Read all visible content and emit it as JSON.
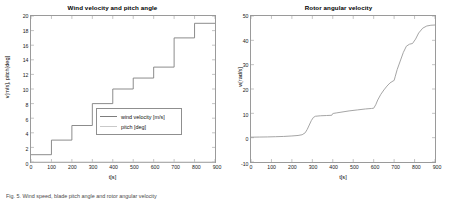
{
  "figure": {
    "caption": "Fig. 5.  Wind speed, blade pitch angle and rotor angular velocity"
  },
  "chart_data": [
    {
      "type": "line",
      "title": "Wind velocity and pitch angle",
      "xlabel": "t[s]",
      "ylabel": "v[m/s], pitch[deg]",
      "xlim": [
        0,
        900
      ],
      "ylim": [
        0,
        20
      ],
      "xticks": [
        0,
        100,
        200,
        300,
        400,
        500,
        600,
        700,
        800,
        900
      ],
      "yticks": [
        0,
        2,
        4,
        6,
        8,
        10,
        12,
        14,
        16,
        18,
        20
      ],
      "grid": false,
      "legend_position": "lower-right",
      "legend": [
        "wind velocity [m/s]",
        "pitch [deg]"
      ],
      "series": [
        {
          "name": "wind velocity [m/s]",
          "color": "#7d7d7d",
          "step": true,
          "x": [
            0,
            100,
            200,
            300,
            400,
            500,
            600,
            700,
            800,
            900
          ],
          "values": [
            1,
            3,
            5,
            8,
            10,
            11.5,
            13,
            17,
            19,
            19
          ]
        },
        {
          "name": "pitch [deg]",
          "color": "#c9c9c9",
          "step": true,
          "x": [
            0,
            900
          ],
          "values": [
            0,
            0
          ]
        }
      ]
    },
    {
      "type": "line",
      "title": "Rotor angular velocity",
      "xlabel": "t[s]",
      "ylabel": "w[rad/s]",
      "xlim": [
        0,
        900
      ],
      "ylim": [
        -10,
        50
      ],
      "xticks": [
        0,
        100,
        200,
        300,
        400,
        500,
        600,
        700,
        800,
        900
      ],
      "yticks": [
        -10,
        0,
        10,
        20,
        30,
        40,
        50
      ],
      "grid": false,
      "legend_position": "none",
      "series": [
        {
          "name": "w[rad/s]",
          "color": "#9a9a9a",
          "step": false,
          "x": [
            0,
            40,
            80,
            120,
            160,
            200,
            230,
            250,
            265,
            275,
            285,
            295,
            305,
            315,
            340,
            370,
            395,
            400,
            405,
            420,
            450,
            480,
            520,
            560,
            590,
            600,
            610,
            620,
            635,
            650,
            665,
            680,
            695,
            700,
            705,
            715,
            730,
            745,
            760,
            775,
            790,
            805,
            820,
            840,
            860,
            880,
            900
          ],
          "values": [
            0.2,
            0.25,
            0.3,
            0.4,
            0.5,
            0.7,
            0.9,
            1.2,
            2.0,
            3.4,
            5.2,
            7.0,
            8.3,
            8.8,
            9.0,
            9.1,
            9.2,
            9.9,
            10.0,
            10.2,
            10.6,
            11.0,
            11.4,
            11.8,
            12.0,
            12.1,
            13.5,
            15.5,
            17.8,
            19.6,
            21.2,
            22.5,
            23.3,
            23.5,
            25.0,
            28.0,
            31.5,
            35.0,
            37.6,
            38.4,
            38.7,
            40.5,
            43.0,
            45.0,
            45.9,
            46.2,
            46.3
          ]
        }
      ]
    }
  ]
}
